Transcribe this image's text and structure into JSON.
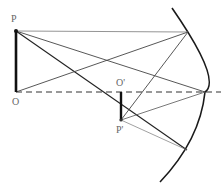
{
  "diagram": {
    "labels": {
      "object_top": "P",
      "object_base": "O",
      "image_base": "O'",
      "image_top": "P'"
    },
    "colors": {
      "ink": "#1a1a1a",
      "ray": "#444444",
      "label": "#666666"
    },
    "points": {
      "P": [
        16,
        31
      ],
      "O": [
        16,
        92
      ],
      "O_prime": [
        121,
        92
      ],
      "P_prime": [
        121,
        120
      ],
      "mirror_upper_hit": [
        188,
        32
      ],
      "mirror_vertex": [
        205,
        92
      ],
      "mirror_lower_hit": [
        187,
        150
      ]
    }
  }
}
